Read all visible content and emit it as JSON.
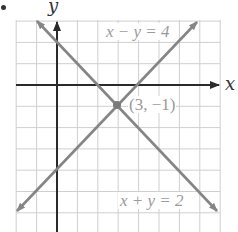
{
  "figure": {
    "bullet": "•",
    "x_axis_label": "x",
    "y_axis_label": "y",
    "colors": {
      "grid": "#cfcfcf",
      "axes": "#2a2a2a",
      "lines": "#858585",
      "label_text": "#9a9a9a",
      "point": "#7a7a7a"
    }
  },
  "labels": {
    "line1": "x − y = 4",
    "line2": "x + y = 2",
    "point": "(3, −1)"
  },
  "chart_data": {
    "type": "line",
    "title": "",
    "xlabel": "x",
    "ylabel": "y",
    "grid": true,
    "xlim": [
      -2,
      8
    ],
    "ylim": [
      -7,
      3
    ],
    "series": [
      {
        "name": "x − y = 4",
        "equation": "y = x - 4",
        "points": [
          [
            -2,
            -6
          ],
          [
            7,
            3
          ]
        ],
        "arrows": "both"
      },
      {
        "name": "x + y = 2",
        "equation": "y = 2 - x",
        "points": [
          [
            -1,
            3
          ],
          [
            8,
            -6
          ]
        ],
        "arrows": "both"
      }
    ],
    "annotations": [
      {
        "text": "(3, −1)",
        "x": 3,
        "y": -1,
        "type": "intersection-point"
      },
      {
        "text": "x − y = 4",
        "near": "upper line end"
      },
      {
        "text": "x + y = 2",
        "near": "lower line end"
      }
    ]
  }
}
